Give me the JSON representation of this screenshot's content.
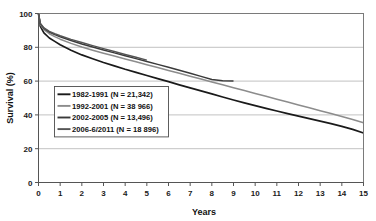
{
  "chart_data": {
    "type": "line",
    "title": "",
    "xlabel": "Years",
    "ylabel": "Survival (%)",
    "xlim": [
      0,
      15
    ],
    "ylim": [
      0,
      100
    ],
    "xticks": [
      "0",
      "1",
      "2",
      "3",
      "4",
      "5",
      "6",
      "7",
      "8",
      "9",
      "10",
      "11",
      "12",
      "13",
      "14",
      "15"
    ],
    "yticks": [
      "0",
      "20",
      "40",
      "60",
      "80",
      "100"
    ],
    "grid": "horizontal",
    "legend_position": "inside-left",
    "series": [
      {
        "name": "1982-1991 (N = 21,342)",
        "label": "1982-1991 (N = 21,342)",
        "color": "#1a1a1a",
        "x": [
          0,
          0.08,
          0.25,
          0.5,
          0.75,
          1,
          1.5,
          2,
          2.5,
          3,
          3.5,
          4,
          4.5,
          5,
          5.5,
          6,
          6.5,
          7,
          7.5,
          8,
          8.5,
          9,
          9.5,
          10,
          10.5,
          11,
          11.5,
          12,
          12.5,
          13,
          13.5,
          14,
          14.5,
          15
        ],
        "y": [
          100,
          92.5,
          88.5,
          85.5,
          83.5,
          81.5,
          78.3,
          75.5,
          73.2,
          71.0,
          69.0,
          67.0,
          65.2,
          63.3,
          61.5,
          59.7,
          57.8,
          56.0,
          54.2,
          52.4,
          50.6,
          48.8,
          47.1,
          45.5,
          43.9,
          42.3,
          40.8,
          39.3,
          37.8,
          36.3,
          34.8,
          33.2,
          31.4,
          29.3
        ]
      },
      {
        "name": "1992-2001 (N = 38 966)",
        "label": "1992-2001 (N = 38 966)",
        "color": "#8c8c8c",
        "x": [
          0,
          0.08,
          0.25,
          0.5,
          0.75,
          1,
          1.5,
          2,
          2.5,
          3,
          3.5,
          4,
          4.5,
          5,
          5.5,
          6,
          6.5,
          7,
          7.5,
          8,
          8.5,
          9,
          9.5,
          10,
          10.5,
          11,
          11.5,
          12,
          12.5,
          13,
          13.5,
          14,
          14.5,
          15
        ],
        "y": [
          100,
          93.5,
          90.5,
          88.0,
          86.3,
          84.8,
          82.3,
          80.2,
          78.3,
          76.5,
          74.8,
          73.1,
          71.4,
          69.7,
          68.0,
          66.3,
          64.6,
          62.9,
          61.2,
          59.5,
          57.8,
          56.1,
          54.4,
          52.7,
          51.0,
          49.3,
          47.6,
          45.9,
          44.2,
          42.5,
          40.8,
          39.1,
          37.3,
          35.4
        ]
      },
      {
        "name": "2002-2005 (N = 13,496)",
        "label": "2002-2005 (N = 13,496)",
        "color": "#3a3a3a",
        "x": [
          0,
          0.08,
          0.25,
          0.5,
          0.75,
          1,
          1.5,
          2,
          2.5,
          3,
          3.5,
          4,
          4.5,
          5,
          5.5,
          6,
          6.5,
          7,
          7.5,
          8,
          8.5,
          9
        ],
        "y": [
          100,
          94.0,
          91.2,
          89.0,
          87.5,
          86.2,
          84.0,
          82.0,
          80.2,
          78.4,
          76.7,
          75.0,
          73.3,
          71.6,
          69.9,
          68.2,
          66.4,
          64.6,
          62.8,
          61.0,
          60.2,
          60.0
        ]
      },
      {
        "name": "2006-6/2011 (N = 18 896)",
        "label": "2006-6/2011 (N = 18 896)",
        "color": "#555555",
        "x": [
          0,
          0.08,
          0.25,
          0.5,
          0.75,
          1,
          1.5,
          2,
          2.5,
          3,
          3.5,
          4,
          4.5,
          5
        ],
        "y": [
          100,
          94.2,
          91.5,
          89.4,
          88.0,
          86.8,
          84.7,
          82.8,
          81.0,
          79.2,
          77.5,
          75.8,
          74.1,
          72.4
        ]
      }
    ]
  },
  "axes": {
    "x_title": "Years",
    "y_title": "Survival (%)"
  }
}
